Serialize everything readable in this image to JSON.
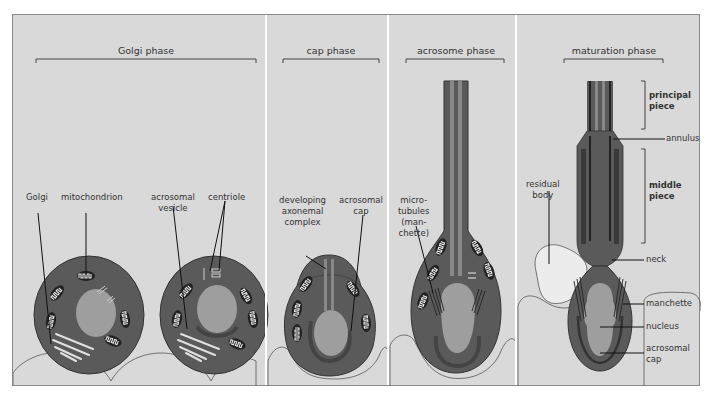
{
  "colors": {
    "background": "#d9d9d9",
    "cytoplasm": "#5a5a5a",
    "nucleus": "#9e9e9e",
    "organelle_fill": "#e8e8e8",
    "line": "#222222",
    "cell_outline": "#555555"
  },
  "phases": [
    {
      "title": "Golgi phase"
    },
    {
      "title": "cap phase"
    },
    {
      "title": "acrosome phase"
    },
    {
      "title": "maturation phase"
    }
  ],
  "labels": {
    "golgi": "Golgi",
    "mitochondrion": "mitochondrion",
    "acrosomal_vesicle_1": "acrosomal",
    "acrosomal_vesicle_2": "vesicle",
    "centriole": "centriole",
    "developing_1": "developing",
    "developing_2": "axonemal",
    "developing_3": "complex",
    "acrosomal_cap_1": "acrosomal",
    "acrosomal_cap_2": "cap",
    "microtubules_1": "micro-",
    "microtubules_2": "tubules",
    "microtubules_3": "(man-",
    "microtubules_4": "chette)",
    "residual_1": "residual",
    "residual_2": "body",
    "principal_1": "principal",
    "principal_2": "piece",
    "annulus": "annulus",
    "middle_1": "middle",
    "middle_2": "piece",
    "neck": "neck",
    "manchette": "manchette",
    "nucleus": "nucleus",
    "mat_acrosomal_cap_1": "acrosomal",
    "mat_acrosomal_cap_2": "cap"
  }
}
